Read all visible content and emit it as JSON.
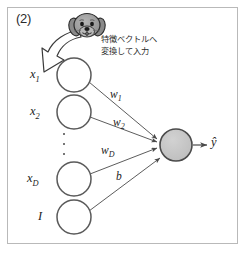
{
  "figure": {
    "panel_label": "(2)",
    "domain_kind": "neural-network-diagram",
    "background_color": "#ffffff",
    "frame_color": "#b9b9b9"
  },
  "annotation": {
    "line1": "特徴ベクトルへ",
    "line2": "変換して入力",
    "icon_name": "dog-face-icon",
    "arrow_name": "curved-block-arrow"
  },
  "input_nodes": [
    {
      "label": "x",
      "sub": "1",
      "cx": 74,
      "cy": 75,
      "r": 17
    },
    {
      "label": "x",
      "sub": "2",
      "cx": 74,
      "cy": 112,
      "r": 17
    },
    {
      "label": "x",
      "sub": "D",
      "cx": 74,
      "cy": 179,
      "r": 17
    },
    {
      "label": "I",
      "sub": "",
      "cx": 74,
      "cy": 217,
      "r": 17
    }
  ],
  "ellipsis": "⋮",
  "weights": [
    {
      "label": "w",
      "sub": "1",
      "x": 110,
      "y": 89
    },
    {
      "label": "w",
      "sub": "2",
      "x": 113,
      "y": 117
    },
    {
      "label": "w",
      "sub": "D",
      "x": 103,
      "y": 145
    },
    {
      "label": "b",
      "sub": "",
      "x": 116,
      "y": 172
    }
  ],
  "output_node": {
    "name": "output-neuron",
    "cx": 176,
    "cy": 145,
    "r": 16,
    "fill": "#c7c7c7",
    "stroke": "#4a4a4a"
  },
  "output": {
    "label": "ŷ"
  },
  "colors": {
    "line": "#4a4a4a",
    "node_stroke": "#5a5a5a",
    "node_fill": "#ffffff",
    "text": "#1d1d1d",
    "dog_fill": "#9a9a9a",
    "dog_stroke": "#2b2b2b"
  }
}
